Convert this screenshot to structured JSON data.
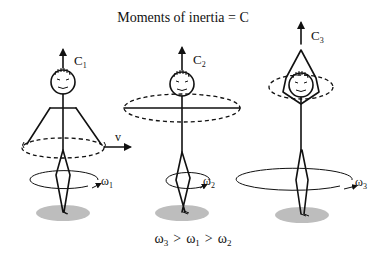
{
  "title": "Moments of inertia = C",
  "relation": {
    "w3": "ω",
    "w3_sub": "3",
    "gt1": ">",
    "w1": "ω",
    "w1_sub": "1",
    "gt2": ">",
    "w2": "ω",
    "w2_sub": "2"
  },
  "figures": [
    {
      "id": "figure-1",
      "axis_label": "C",
      "axis_sub": "1",
      "omega": "ω",
      "omega_sub": "1",
      "velocity_label": "v",
      "pose": "arms-lowered"
    },
    {
      "id": "figure-2",
      "axis_label": "C",
      "axis_sub": "2",
      "omega": "ω",
      "omega_sub": "2",
      "pose": "arms-extended"
    },
    {
      "id": "figure-3",
      "axis_label": "C",
      "axis_sub": "3",
      "omega": "ω",
      "omega_sub": "3",
      "pose": "arms-overhead"
    }
  ],
  "colors": {
    "ink": "#111111",
    "shadow": "#bdbdbd",
    "background": "#ffffff"
  }
}
